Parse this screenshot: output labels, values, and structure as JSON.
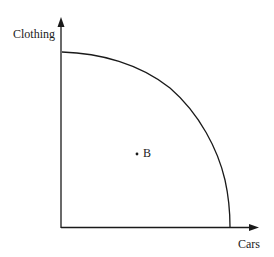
{
  "diagram": {
    "type": "production-possibility-frontier",
    "y_axis_label": "Clothing",
    "x_axis_label": "Cars",
    "points": [
      {
        "label": "B",
        "position": "inside-frontier"
      }
    ],
    "colors": {
      "line": "#1a1a1a",
      "background": "#ffffff"
    }
  }
}
